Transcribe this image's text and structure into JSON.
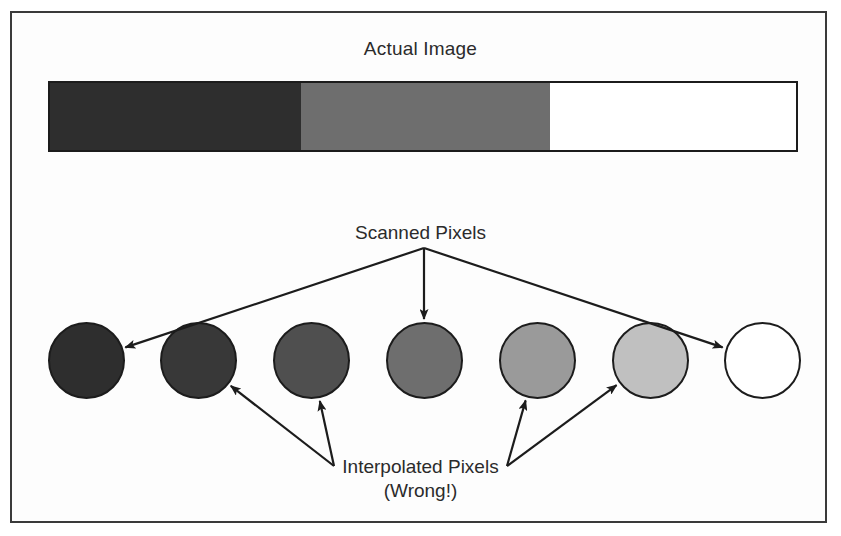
{
  "figure": {
    "background_color": "#ffffff",
    "frame_border_color": "#3a3a3a"
  },
  "actual_image": {
    "title": "Actual Image",
    "bar_segments": [
      {
        "name": "dark-segment",
        "color": "#2e2e2e",
        "width_px": 252
      },
      {
        "name": "gray-segment",
        "color": "#6e6e6e",
        "width_px": 251
      },
      {
        "name": "white-segment",
        "color": "#ffffff",
        "width_px": 247
      }
    ],
    "bar_outline_color": "#1c1c1c"
  },
  "scanned": {
    "label": "Scanned Pixels",
    "arrow_targets": [
      "pixel-1",
      "pixel-4",
      "pixel-7"
    ]
  },
  "interpolated": {
    "label": "Interpolated Pixels",
    "sublabel": "(Wrong!)",
    "arrow_targets": [
      "pixel-2",
      "pixel-3",
      "pixel-5",
      "pixel-6"
    ]
  },
  "pixels": [
    {
      "id": "pixel-1",
      "name": "scanned-pixel-1",
      "color": "#2e2e2e",
      "kind": "scanned",
      "cx": 86,
      "left": 48
    },
    {
      "id": "pixel-2",
      "name": "interpolated-pixel-2",
      "color": "#383838",
      "kind": "interpolated",
      "cx": 198,
      "left": 160
    },
    {
      "id": "pixel-3",
      "name": "interpolated-pixel-3",
      "color": "#4f4f4f",
      "kind": "interpolated",
      "cx": 311,
      "left": 273
    },
    {
      "id": "pixel-4",
      "name": "scanned-pixel-4",
      "color": "#6e6e6e",
      "kind": "scanned",
      "cx": 424,
      "left": 386
    },
    {
      "id": "pixel-5",
      "name": "interpolated-pixel-5",
      "color": "#9a9a9a",
      "kind": "interpolated",
      "cx": 537,
      "left": 499
    },
    {
      "id": "pixel-6",
      "name": "interpolated-pixel-6",
      "color": "#c0c0c0",
      "kind": "interpolated",
      "cx": 650,
      "left": 612
    },
    {
      "id": "pixel-7",
      "name": "scanned-pixel-7",
      "color": "#ffffff",
      "kind": "scanned",
      "cx": 762,
      "left": 724
    }
  ],
  "colors": {
    "ink": "#1c1c1c",
    "text": "#2b2b2b",
    "arrow": "#1c1c1c"
  }
}
